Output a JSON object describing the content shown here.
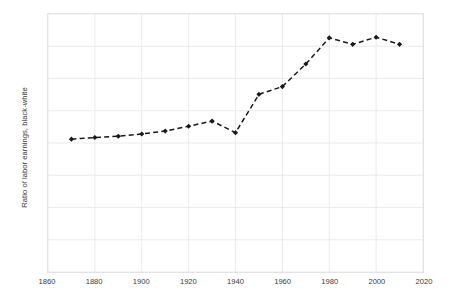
{
  "chart_data": {
    "type": "line",
    "title": "",
    "xlabel": "",
    "ylabel": "Ratio of labor earnings, black-white",
    "xlim": [
      1860,
      2020
    ],
    "ylim": [
      0.0,
      0.8
    ],
    "xticks": [
      1860,
      1880,
      1900,
      1920,
      1940,
      1960,
      1980,
      2000,
      2020
    ],
    "xtick_labels": [
      "1860",
      "1880",
      "1900",
      "1920",
      "1940",
      "1960",
      "1980",
      "2000",
      "2020"
    ],
    "yticks": [
      0.0,
      0.1,
      0.2,
      0.3,
      0.4,
      0.5,
      0.6,
      0.7,
      0.8
    ],
    "ytick_labels": [
      "0.00",
      "0.10",
      "0.20",
      "0.30",
      "0.40",
      "0.50",
      "0.60",
      "0.70",
      "0.80"
    ],
    "grid": true,
    "legend": "none",
    "line_style": "dashed",
    "marker": "diamond",
    "color": "#1a1a1a",
    "x": [
      1870,
      1880,
      1890,
      1900,
      1910,
      1920,
      1930,
      1940,
      1950,
      1960,
      1970,
      1980,
      1990,
      2000,
      2010
    ],
    "values": [
      0.412,
      0.417,
      0.421,
      0.428,
      0.437,
      0.452,
      0.468,
      0.432,
      0.551,
      0.575,
      0.645,
      0.726,
      0.706,
      0.728,
      0.706
    ],
    "series": [
      {
        "name": "Ratio of labor earnings, black-white",
        "values": [
          0.412,
          0.417,
          0.421,
          0.428,
          0.437,
          0.452,
          0.468,
          0.432,
          0.551,
          0.575,
          0.645,
          0.726,
          0.706,
          0.728,
          0.706
        ]
      }
    ]
  }
}
